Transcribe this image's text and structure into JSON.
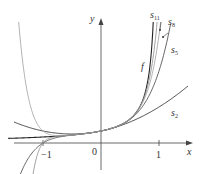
{
  "chart_data": {
    "type": "line",
    "title": "",
    "xlabel": "x",
    "ylabel": "y",
    "function": "f(x) = 1/(1 - x)",
    "xlim": [
      -1.6,
      1.6
    ],
    "ylim": [
      -2.6,
      11.9
    ],
    "x_ticks": [
      {
        "value": -1,
        "label": "−1"
      },
      {
        "value": 0,
        "label": "0"
      },
      {
        "value": 1,
        "label": "1"
      }
    ],
    "series": [
      {
        "name": "f",
        "kind": "function",
        "color": "#222222",
        "x_range": [
          -1.6,
          0.905
        ],
        "sample_points": [
          [
            -1.5,
            0.4
          ],
          [
            -1,
            0.5
          ],
          [
            -0.5,
            0.667
          ],
          [
            0,
            1
          ],
          [
            0.5,
            2
          ],
          [
            0.7,
            3.33
          ],
          [
            0.8,
            5
          ],
          [
            0.85,
            6.67
          ],
          [
            0.9,
            10
          ]
        ]
      },
      {
        "name": "s_2",
        "kind": "partial_sum",
        "n": 2,
        "color": "#333333",
        "x_range": [
          -1.5,
          1.5
        ],
        "sample_points": [
          [
            -1.5,
            1.75
          ],
          [
            -1,
            1
          ],
          [
            -0.5,
            0.75
          ],
          [
            0,
            1
          ],
          [
            0.5,
            1.75
          ],
          [
            1,
            3
          ],
          [
            1.5,
            4.75
          ]
        ]
      },
      {
        "name": "s_5",
        "kind": "partial_sum",
        "n": 5,
        "color": "#555555",
        "x_range": [
          -1.5,
          1.2
        ],
        "sample_points": [
          [
            -1,
            0
          ],
          [
            -0.5,
            0.656
          ],
          [
            0,
            1
          ],
          [
            0.5,
            1.969
          ],
          [
            0.8,
            3.69
          ],
          [
            1,
            6
          ],
          [
            1.2,
            8.93
          ]
        ]
      },
      {
        "name": "s_8",
        "kind": "partial_sum",
        "n": 8,
        "color": "#aaaaaa",
        "x_range": [
          -1.5,
          1.05
        ],
        "sample_points": [
          [
            -1,
            1
          ],
          [
            -0.5,
            0.668
          ],
          [
            0,
            1
          ],
          [
            0.5,
            1.996
          ],
          [
            0.8,
            4.33
          ],
          [
            1,
            9
          ]
        ]
      },
      {
        "name": "s_11",
        "kind": "partial_sum",
        "n": 11,
        "color": "#999999",
        "x_range": [
          -1.2,
          0.97
        ],
        "sample_points": [
          [
            -1,
            0
          ],
          [
            -0.5,
            0.667
          ],
          [
            0,
            1
          ],
          [
            0.5,
            2.0
          ],
          [
            0.8,
            4.66
          ],
          [
            0.9,
            6.86
          ],
          [
            0.95,
            8.1
          ]
        ]
      }
    ],
    "annotations": [
      {
        "text": "f",
        "x": 0.78,
        "y": 5.8
      },
      {
        "text": "s_11",
        "x": 0.88,
        "y": 11.2
      },
      {
        "text": "s_8",
        "x": 1.13,
        "y": 10.3
      },
      {
        "text": "s_5",
        "x": 1.15,
        "y": 7.6
      },
      {
        "text": "s_2",
        "x": 1.2,
        "y": 3.4
      }
    ],
    "grid": false,
    "legend": "none (inline curve labels)"
  },
  "axes": {
    "x_label": "x",
    "y_label": "y",
    "origin_label": "0"
  },
  "labels": {
    "f": "f",
    "s11_base": "s",
    "s11_sub": "11",
    "s8_base": "s",
    "s8_sub": "8",
    "s5_base": "s",
    "s5_sub": "5",
    "s2_base": "s",
    "s2_sub": "2",
    "tick_neg1": "−1",
    "tick_pos1": "1"
  }
}
